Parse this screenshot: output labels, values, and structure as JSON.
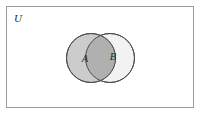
{
  "figure": {
    "kind": "venn-diagram",
    "width": 204,
    "height": 115,
    "background_color": "#ffffff"
  },
  "universe": {
    "label": "U",
    "border_color": "#9a9a9a",
    "fill_color": "#ffffff",
    "rect": {
      "x": 6,
      "y": 6,
      "width": 188,
      "height": 102
    },
    "label_position": {
      "x": 14,
      "y": 22
    }
  },
  "sets": [
    {
      "id": "A",
      "label": "A",
      "fill_color": "#cccccc",
      "stroke_color": "#4d4d4d",
      "center": {
        "x": 91,
        "y": 58
      },
      "radius": 24.5,
      "label_position": {
        "x": 85,
        "y": 62
      }
    },
    {
      "id": "B",
      "label": "B",
      "fill_color": "#f2f2f2",
      "stroke_color": "#4d4d4d",
      "center": {
        "x": 110,
        "y": 58
      },
      "radius": 24.5,
      "label_position": {
        "x": 113,
        "y": 60
      }
    }
  ],
  "intersection": {
    "id": "A-and-B",
    "fill_color": "#b0b0b0",
    "shaded": true
  }
}
